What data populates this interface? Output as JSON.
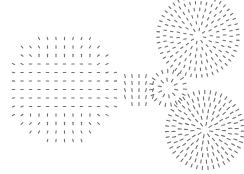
{
  "diagram": {
    "title": "",
    "background": "#ffffff",
    "glyph_color": "#6f6f6f",
    "width": 244,
    "height": 174,
    "clusters": [
      {
        "name": "large-left-grid-circle",
        "cx": 62,
        "cy": 87,
        "r": 57,
        "mode": "grid",
        "spacing": 8.5,
        "dash": 2.4
      },
      {
        "name": "top-right-circle",
        "cx": 198,
        "cy": 36,
        "r": 40,
        "mode": "radial-rings",
        "rings": 6,
        "dash": 2.6
      },
      {
        "name": "center-burst",
        "cx": 168,
        "cy": 88,
        "r": 17,
        "mode": "radial-rings",
        "rings": 2,
        "dash": 3.2
      },
      {
        "name": "middle-column-cluster",
        "cx": 137,
        "cy": 88,
        "r": 19,
        "mode": "vertical-grid",
        "spacing": 7,
        "dash": 3.0
      },
      {
        "name": "bottom-right-circle",
        "cx": 205,
        "cy": 130,
        "r": 38,
        "mode": "radial-rings",
        "rings": 6,
        "dash": 3.2
      }
    ]
  }
}
